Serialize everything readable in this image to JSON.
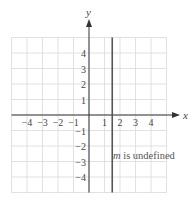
{
  "chart_data": {
    "type": "line",
    "title": "",
    "xlabel": "x",
    "ylabel": "y",
    "xlim": [
      -5,
      5
    ],
    "ylim": [
      -5,
      5
    ],
    "grid": true,
    "x_ticks": [
      -4,
      -3,
      -2,
      -1,
      1,
      2,
      3,
      4
    ],
    "y_ticks": [
      4,
      3,
      2,
      1,
      -1,
      -2,
      -3,
      -4
    ],
    "x_tick_labels": [
      "−4",
      "−3",
      "−2",
      "−1",
      "1",
      "2",
      "3",
      "4"
    ],
    "y_tick_labels": [
      "4",
      "3",
      "2",
      "1",
      "−1",
      "−2",
      "−3",
      "−4"
    ],
    "series": [
      {
        "name": "vertical line",
        "equation": "x = 1.5",
        "x": [
          1.5,
          1.5
        ],
        "y": [
          -5,
          5
        ],
        "color": "#555555"
      }
    ],
    "annotations": [
      {
        "text_italic": "m",
        "text": " is undefined",
        "x": 1.55,
        "y": -2.6
      }
    ]
  },
  "labels": {
    "x_axis": "x",
    "y_axis": "y",
    "annotation_var": "m",
    "annotation_rest": " is undefined"
  },
  "colors": {
    "grid": "#d9d9d9",
    "axis": "#333333",
    "line": "#555555",
    "text": "#444444"
  }
}
